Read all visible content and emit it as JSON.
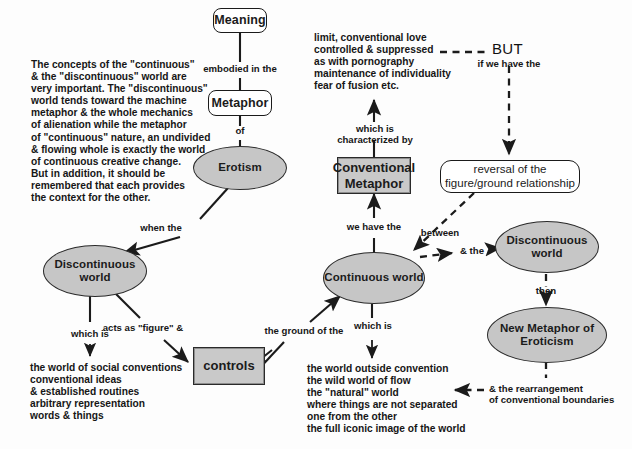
{
  "diagram": {
    "colors": {
      "background": "#fdfdfd",
      "node_fill_gray": "#c6c6c6",
      "box_fill_gray": "#c9c9c9",
      "stroke": "#1b1b1b",
      "text": "#161616"
    }
  },
  "nodes": {
    "meaning": "Meaning",
    "metaphor": "Metaphor",
    "erotism": "Erotism",
    "discontinuous_world_left": "Discontinuous\nworld",
    "continuous_world": "Continuous\nworld",
    "conventional_metaphor": "Conventional\nMetaphor",
    "controls": "controls",
    "reversal": "reversal of the\nfigure/ground relationship",
    "discontinuous_world_right": "Discontinuous\nworld",
    "new_metaphor": "New Metaphor of\nEroticism"
  },
  "link_labels": {
    "embodied_in_the": "embodied in the",
    "of": "of",
    "when_the": "when the",
    "which_is_left": "which is",
    "acts_as_figure": "acts as \"figure\" &",
    "the_ground_of_the": "the ground of the",
    "which_is_center": "which is",
    "we_have_the": "we have the",
    "which_is_characterized_by": "which is\ncharacterized by",
    "but": "BUT",
    "if_we_have_the": "if we have the",
    "between": "between",
    "and_the": "& the",
    "then": "then",
    "and_the_rearrangement": "& the rearrangement\nof conventional boundaries"
  },
  "text_blocks": {
    "commentary": "The concepts of the \"continuous\"\n& the \"discontinuous\" world are\nvery important. The \"discontinuous\"\nworld tends toward the machine\nmetaphor & the whole mechanics\nof alienation while the metaphor\nof \"continuous\" nature, an undivided\n& flowing whole is exactly the world\nof continuous creative change.\nBut in addition, it should be\nremembered that each provides\nthe context for the other.",
    "conventional_metaphor_traits": "limit, conventional love\ncontrolled & suppressed\nas with pornography\nmaintenance of individuality\nfear of fusion etc.",
    "discontinuous_world_traits": "the world of social conventions\nconventional ideas\n& established routines\narbitrary representation\nwords & things",
    "continuous_world_traits": "the world outside convention\nthe wild world of flow\nthe \"natural\" world\nwhere things are not separated\none from the other\nthe full iconic image of the world"
  }
}
